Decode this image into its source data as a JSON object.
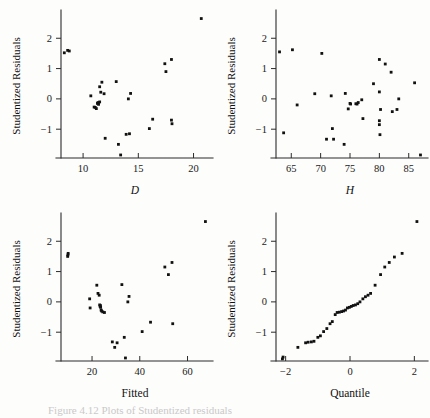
{
  "figure": {
    "background_color": "#fdfdfc",
    "point_color": "#111111",
    "axis_color": "#2b2b2b",
    "caption_fragment": "Figure 4.12  Plots of Studentized residuals"
  },
  "chart_data": [
    {
      "id": "panel-D",
      "type": "scatter",
      "title": "",
      "xlabel": "D",
      "ylabel": "Studentized Residuals",
      "xlabel_style": "italic",
      "xlim": [
        8.0,
        21.4
      ],
      "ylim": [
        -1.95,
        2.8
      ],
      "xticks": [
        10,
        15,
        20
      ],
      "yticks": [
        -1,
        0,
        1,
        2
      ],
      "xticklabels": [
        "10",
        "15",
        "20"
      ],
      "yticklabels": [
        "−1",
        "0",
        "1",
        "2"
      ],
      "grid": false,
      "legend": "none",
      "x": [
        8.3,
        8.6,
        8.75,
        10.7,
        11.0,
        11.1,
        11.2,
        11.3,
        11.35,
        11.4,
        11.5,
        11.5,
        11.6,
        11.7,
        11.9,
        12.0,
        13.0,
        13.2,
        13.4,
        13.9,
        14.1,
        14.2,
        14.3,
        16.0,
        16.3,
        17.4,
        17.5,
        18.0,
        18.0,
        18.05,
        20.7
      ],
      "y": [
        1.52,
        1.6,
        1.58,
        0.1,
        -0.27,
        -0.28,
        -0.32,
        -0.15,
        -0.12,
        -0.18,
        -0.1,
        0.4,
        0.22,
        0.55,
        0.17,
        -1.3,
        0.57,
        -1.5,
        -1.85,
        -1.17,
        0.0,
        -1.15,
        0.18,
        -0.98,
        -0.67,
        1.16,
        0.9,
        1.3,
        -0.7,
        -0.82,
        2.65
      ]
    },
    {
      "id": "panel-H",
      "type": "scatter",
      "title": "",
      "xlabel": "H",
      "ylabel": "Studentized Residuals",
      "xlabel_style": "italic",
      "xlim": [
        62.4,
        87.6
      ],
      "ylim": [
        -1.95,
        2.8
      ],
      "xticks": [
        65,
        70,
        75,
        80,
        85
      ],
      "yticks": [
        -1,
        0,
        1,
        2
      ],
      "xticklabels": [
        "65",
        "70",
        "75",
        "80",
        "85"
      ],
      "yticklabels": [
        "−1",
        "0",
        "1",
        "2"
      ],
      "grid": false,
      "legend": "none",
      "x": [
        63.0,
        63.7,
        65.2,
        66.0,
        69.0,
        70.2,
        71.0,
        71.8,
        72.0,
        72.2,
        74.0,
        74.2,
        74.7,
        75.0,
        75.1,
        76.0,
        76.2,
        76.4,
        77.0,
        77.2,
        79.0,
        80.0,
        80.0,
        80.0,
        80.0,
        80.1,
        80.2,
        81.0,
        82.0,
        82.2,
        83.0,
        83.3,
        86.0,
        87.0
      ],
      "y": [
        1.55,
        -1.12,
        1.62,
        -0.2,
        0.17,
        1.5,
        -1.33,
        0.1,
        -0.98,
        -1.33,
        -1.5,
        0.18,
        -0.33,
        -0.15,
        -0.17,
        -0.16,
        -0.17,
        -0.12,
        -0.03,
        -0.65,
        0.5,
        1.3,
        0.23,
        -0.72,
        -0.85,
        -1.18,
        -0.35,
        1.15,
        0.88,
        -0.42,
        -0.35,
        0.0,
        0.53,
        -1.85,
        2.65
      ]
    },
    {
      "id": "panel-Fitted",
      "type": "scatter",
      "title": "",
      "xlabel": "Fitted",
      "ylabel": "Studentized Residuals",
      "xlabel_style": "roman",
      "xlim": [
        7.0,
        69.0
      ],
      "ylim": [
        -1.95,
        2.8
      ],
      "xticks": [
        20,
        40,
        60
      ],
      "yticks": [
        -1,
        0,
        1,
        2
      ],
      "xticklabels": [
        "20",
        "40",
        "60"
      ],
      "yticklabels": [
        "−1",
        "0",
        "1",
        "2"
      ],
      "grid": false,
      "legend": "none",
      "x": [
        9.8,
        9.9,
        10.0,
        19.0,
        19.2,
        22.0,
        22.5,
        23.0,
        23.2,
        23.4,
        23.5,
        23.6,
        23.8,
        24.0,
        24.5,
        25.2,
        28.5,
        29.5,
        30.5,
        32.5,
        33.5,
        34.0,
        35.0,
        35.5,
        41.0,
        44.5,
        50.5,
        52.0,
        53.5,
        53.8,
        67.5
      ],
      "y": [
        1.5,
        1.55,
        1.6,
        0.1,
        -0.2,
        0.55,
        0.28,
        0.22,
        -0.1,
        -0.15,
        -0.12,
        -0.18,
        -0.27,
        -0.3,
        -0.33,
        -0.35,
        -1.32,
        -1.5,
        -1.35,
        0.57,
        -1.17,
        -1.85,
        0.0,
        0.18,
        -0.98,
        -0.67,
        1.15,
        0.9,
        1.3,
        -0.72,
        2.65
      ]
    },
    {
      "id": "panel-QQ",
      "type": "scatter",
      "title": "",
      "xlabel": "Quantile",
      "ylabel": "Studentized Residuals",
      "xlabel_style": "roman",
      "xlim": [
        -2.3,
        2.3
      ],
      "ylim": [
        -1.95,
        2.8
      ],
      "xticks": [
        -2,
        0,
        2
      ],
      "yticks": [
        -1,
        0,
        1,
        2
      ],
      "xticklabels": [
        "−2",
        "0",
        "2"
      ],
      "yticklabels": [
        "−1",
        "0",
        "1",
        "2"
      ],
      "grid": false,
      "legend": "none",
      "x": [
        -2.1,
        -2.08,
        -1.62,
        -1.38,
        -1.3,
        -1.2,
        -1.12,
        -1.0,
        -0.92,
        -0.82,
        -0.72,
        -0.62,
        -0.55,
        -0.46,
        -0.4,
        -0.33,
        -0.26,
        -0.2,
        -0.14,
        -0.08,
        -0.02,
        0.04,
        0.1,
        0.17,
        0.24,
        0.31,
        0.4,
        0.48,
        0.56,
        0.64,
        0.78,
        0.95,
        1.08,
        1.22,
        1.38,
        1.62,
        2.08
      ],
      "y": [
        -1.88,
        -1.82,
        -1.5,
        -1.35,
        -1.33,
        -1.32,
        -1.3,
        -1.17,
        -1.12,
        -0.98,
        -0.88,
        -0.72,
        -0.65,
        -0.42,
        -0.35,
        -0.34,
        -0.32,
        -0.3,
        -0.27,
        -0.2,
        -0.18,
        -0.15,
        -0.12,
        -0.1,
        -0.06,
        0.0,
        0.1,
        0.17,
        0.22,
        0.28,
        0.55,
        0.9,
        1.15,
        1.3,
        1.48,
        1.6,
        2.65
      ]
    }
  ]
}
